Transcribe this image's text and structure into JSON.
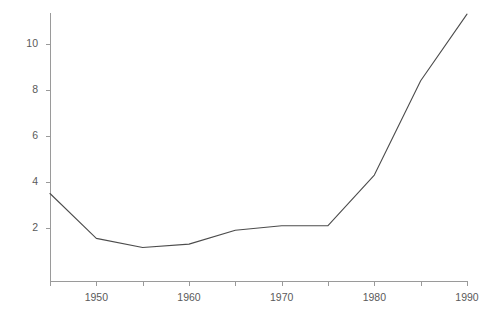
{
  "chart_data": {
    "type": "line",
    "title": "",
    "cut_off_title": "",
    "xlabel": "",
    "ylabel": "",
    "x": [
      1945,
      1950,
      1955,
      1960,
      1965,
      1970,
      1975,
      1980,
      1985,
      1990
    ],
    "values": [
      3.5,
      1.55,
      1.15,
      1.3,
      1.9,
      2.1,
      2.1,
      4.3,
      8.4,
      11.3
    ],
    "series": [
      {
        "name": "series-1",
        "values": [
          3.5,
          1.55,
          1.15,
          1.3,
          1.9,
          2.1,
          2.1,
          4.3,
          8.4,
          11.3
        ]
      }
    ],
    "xlim": [
      1945,
      1990
    ],
    "ylim": [
      0.0,
      11.6
    ],
    "grid": false,
    "legend": false,
    "legend_position": "none",
    "line_color": "#4c4c4c",
    "axis_color": "#9a9a9a",
    "background_color": "#ffffff",
    "y_ticks": [
      {
        "value": 10,
        "label": "10"
      },
      {
        "value": 8,
        "label": "8"
      },
      {
        "value": 6,
        "label": "6"
      },
      {
        "value": 4,
        "label": "4"
      },
      {
        "value": 2,
        "label": "2"
      }
    ],
    "x_ticks": [
      {
        "value": 1945,
        "label": ""
      },
      {
        "value": 1950,
        "label": "1950"
      },
      {
        "value": 1955,
        "label": ""
      },
      {
        "value": 1960,
        "label": "1960"
      },
      {
        "value": 1965,
        "label": ""
      },
      {
        "value": 1970,
        "label": "1970"
      },
      {
        "value": 1975,
        "label": ""
      },
      {
        "value": 1980,
        "label": "1980"
      },
      {
        "value": 1985,
        "label": ""
      },
      {
        "value": 1990,
        "label": "1990"
      }
    ]
  }
}
